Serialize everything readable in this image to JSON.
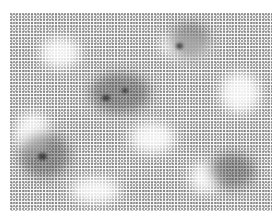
{
  "image": {
    "description": "Grayscale microscopy-like stippled texture with dark clustered regions and white voids",
    "frame": {
      "x": 10,
      "y": 13,
      "width": 262,
      "height": 198
    },
    "colors": {
      "background": "#ffffff",
      "stipple": "#6e6e6e",
      "dark_cluster": "#3a3a3a",
      "void": "#f8f8f8"
    }
  }
}
